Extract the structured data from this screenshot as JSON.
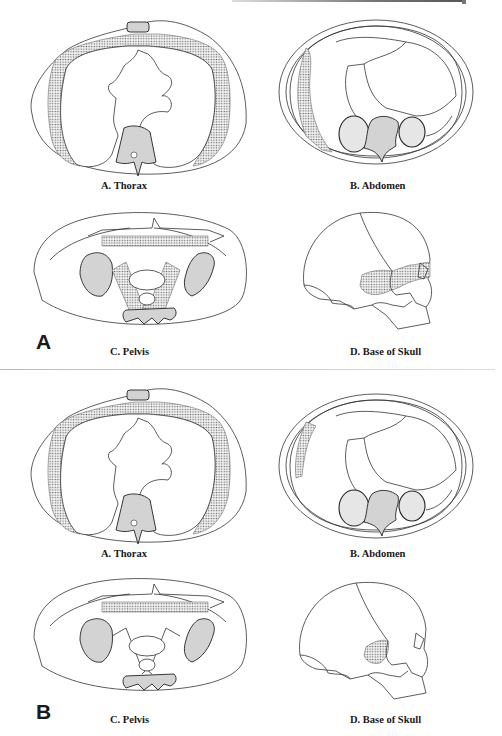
{
  "page": {
    "domain_note": "Scanned figure page: two panels of anatomical line drawings with stippled target regions"
  },
  "colors": {
    "line": "#333333",
    "bone_fill": "#d3d3d3",
    "organ_fill": "#e6e6e6",
    "stipple": "#6a6a6a",
    "background": "#ffffff"
  },
  "panels": [
    {
      "label": "A",
      "figures": [
        {
          "id": "thorax",
          "caption": "A. Thorax",
          "stippled_region": "chest-wall-rim"
        },
        {
          "id": "abdomen",
          "caption": "B. Abdomen",
          "stippled_region": "right-lateral-wall-long"
        },
        {
          "id": "pelvis",
          "caption": "C. Pelvis",
          "stippled_region": "anterior-band-and-sacroiliac-wings"
        },
        {
          "id": "skull",
          "caption": "D. Base of Skull",
          "stippled_region": "temporal-to-orbit-band"
        }
      ]
    },
    {
      "label": "B",
      "figures": [
        {
          "id": "thorax",
          "caption": "A. Thorax",
          "stippled_region": "chest-wall-rim"
        },
        {
          "id": "abdomen",
          "caption": "B. Abdomen",
          "stippled_region": "right-lateral-wall-short"
        },
        {
          "id": "pelvis",
          "caption": "C. Pelvis",
          "stippled_region": "anterior-band"
        },
        {
          "id": "skull",
          "caption": "D. Base of Skull",
          "stippled_region": "temporal-patch"
        }
      ]
    }
  ]
}
